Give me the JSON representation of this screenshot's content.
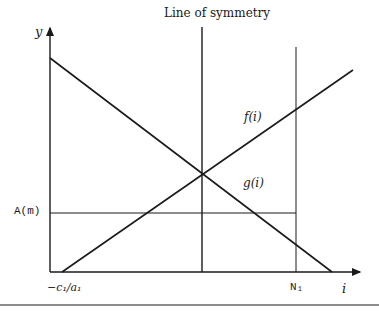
{
  "diagram": {
    "title": "Line of symmetry",
    "y_axis_label": "y",
    "x_axis_label": "i",
    "curve_f_label": "f(i)",
    "curve_g_label": "g(i)",
    "level_label": "A(m)",
    "x_intercept_label": "−c₁/a₁",
    "n1_label": "N₁",
    "colors": {
      "line": "#1a1a1a",
      "background": "#ffffff"
    }
  }
}
